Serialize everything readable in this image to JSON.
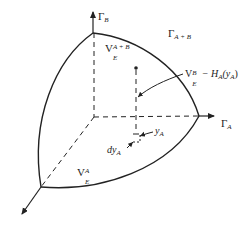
{
  "diagram": {
    "type": "3d-phase-volume-sketch",
    "axes": {
      "vertical": {
        "base": "Γ",
        "subscript": "B"
      },
      "horizontal": {
        "base": "Γ",
        "subscript": "A"
      },
      "depth": {
        "label": ""
      }
    },
    "labels": {
      "total_space": {
        "base": "Γ",
        "subscript": "A + B"
      },
      "total_volume": {
        "base": "V",
        "superscript": "A + B",
        "subscript": "E"
      },
      "subvolume_a": {
        "base": "V",
        "superscript": "A",
        "subscript": "E"
      },
      "slice_volume": {
        "base": "V",
        "superscript": "B",
        "subscript": "E",
        "suffix": "− H",
        "suffix_sub": "A",
        "suffix_arg": "(y",
        "suffix_arg_sub": "A",
        "suffix_close": ")"
      },
      "point_ya": {
        "base": "y",
        "subscript": "A"
      },
      "element_dya": {
        "base": "dy",
        "subscript": "A"
      }
    },
    "colors": {
      "stroke": "#222222",
      "background": "#ffffff"
    }
  }
}
